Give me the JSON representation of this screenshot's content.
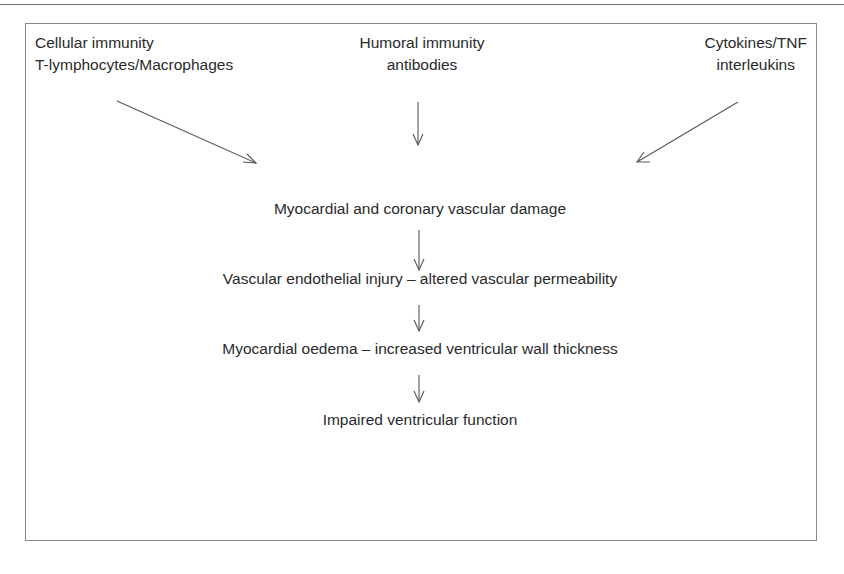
{
  "diagram": {
    "inputs": [
      {
        "line1": "Cellular immunity",
        "line2": "T-lymphocytes/Macrophages"
      },
      {
        "line1": "Humoral immunity",
        "line2": "antibodies"
      },
      {
        "line1": "Cytokines/TNF",
        "line2": "interleukins"
      }
    ],
    "chain": [
      "Myocardial and coronary vascular damage",
      "Vascular endothelial injury – altered vascular permeability",
      "Myocardial oedema – increased ventricular wall thickness",
      "Impaired ventricular function"
    ],
    "colors": {
      "text": "#2a2a2a",
      "line": "#555555",
      "border": "#8a8a8a"
    }
  }
}
